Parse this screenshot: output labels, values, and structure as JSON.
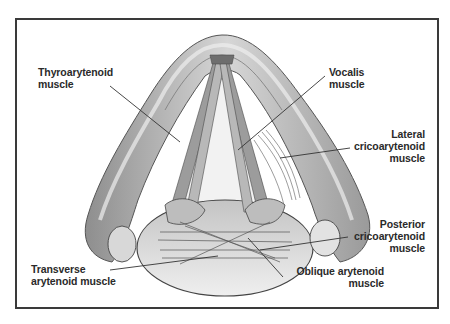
{
  "figure": {
    "labels": {
      "thyroarytenoid": "Thyroarytenoid\nmuscle",
      "vocalis": "Vocalis\nmuscle",
      "lateral_cricoarytenoid": "Lateral\ncricoarytenoid\nmuscle",
      "posterior_cricoarytenoid": "Posterior\ncricoarytenoid\nmuscle",
      "transverse_arytenoid": "Transverse\narytenoid muscle",
      "oblique_arytenoid": "Oblique arytenoid\nmuscle"
    },
    "colors": {
      "frame": "#3a3a3a",
      "cartilage": "#a8a8a8",
      "cartilage_light": "#dcdcdc",
      "muscle": "#8a8a8a",
      "leader_line": "#333333",
      "background": "#ffffff"
    }
  }
}
